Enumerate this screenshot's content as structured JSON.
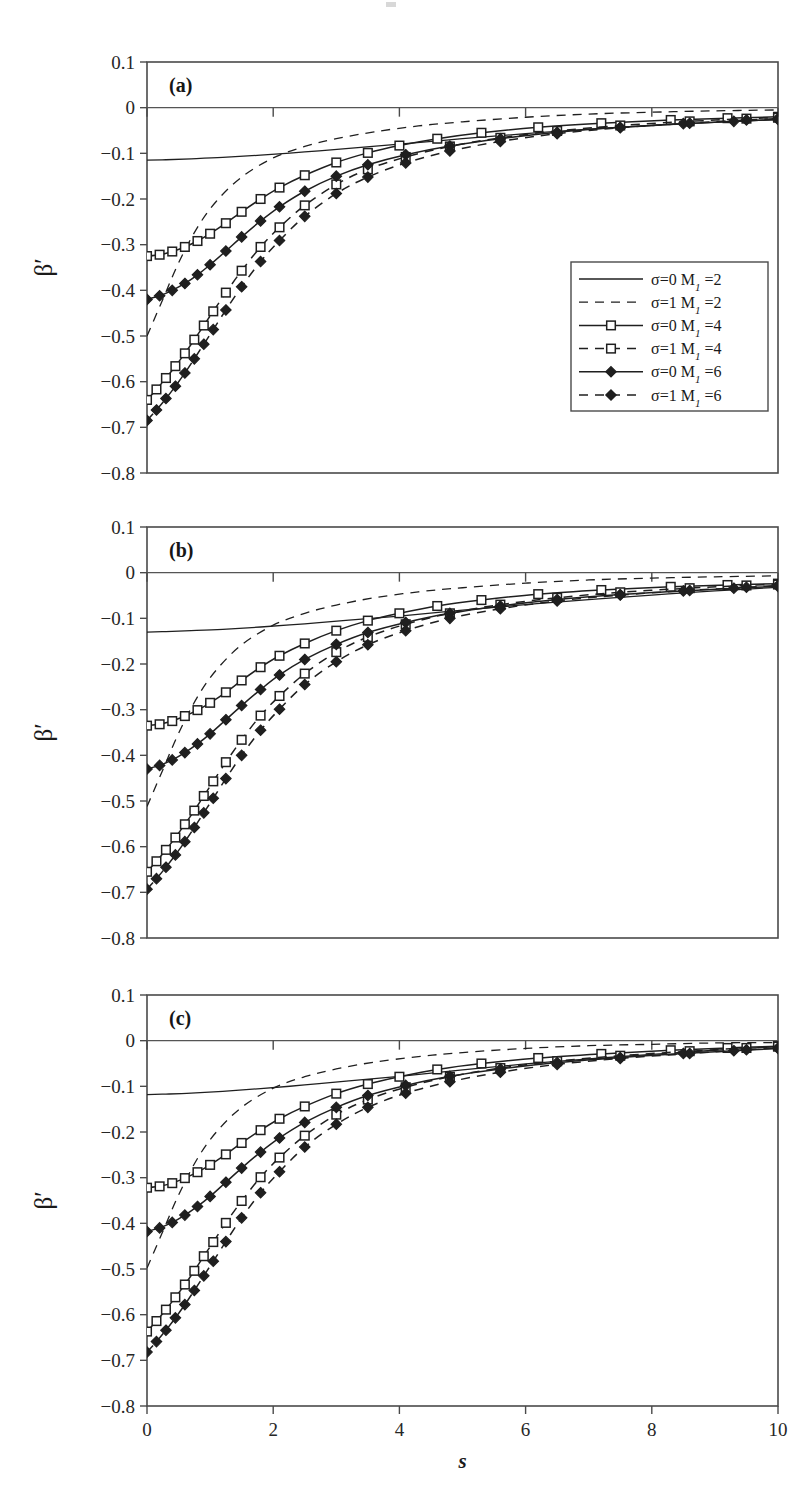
{
  "figure": {
    "panel_labels": [
      "(a)",
      "(b)",
      "(c)"
    ],
    "y_axis_title": "β′",
    "x_axis_title": "s",
    "y_ticks": [
      "0.1",
      "0",
      "−0.1",
      "−0.2",
      "−0.3",
      "−0.4",
      "−0.5",
      "−0.6",
      "−0.7",
      "−0.8"
    ],
    "x_ticks": [
      "0",
      "2",
      "4",
      "6",
      "8",
      "10"
    ],
    "legend": {
      "entries": [
        {
          "label": "σ=0 M",
          "sub": "1",
          "tail": " =2",
          "style": "solid",
          "marker": "none"
        },
        {
          "label": "σ=1 M",
          "sub": "1",
          "tail": " =2",
          "style": "dashed",
          "marker": "none"
        },
        {
          "label": "σ=0 M",
          "sub": "1",
          "tail": " =4",
          "style": "solid",
          "marker": "square"
        },
        {
          "label": "σ=1 M",
          "sub": "1",
          "tail": " =4",
          "style": "dashed",
          "marker": "square"
        },
        {
          "label": "σ=0 M",
          "sub": "1",
          "tail": " =6",
          "style": "solid",
          "marker": "diamond"
        },
        {
          "label": "σ=1 M",
          "sub": "1",
          "tail": " =6",
          "style": "dashed",
          "marker": "diamond"
        }
      ]
    }
  },
  "chart_data": {
    "type": "line",
    "title": "",
    "xlabel": "s",
    "ylabel": "β′",
    "xlim": [
      0,
      10
    ],
    "ylim": [
      -0.8,
      0.1
    ],
    "xticks": [
      0,
      2,
      4,
      6,
      8,
      10
    ],
    "yticks": [
      0.1,
      0,
      -0.1,
      -0.2,
      -0.3,
      -0.4,
      -0.5,
      -0.6,
      -0.7,
      -0.8
    ],
    "grid": false,
    "legend_position": "inside-right-panel-a",
    "panels": [
      {
        "label": "(a)",
        "series": [
          {
            "name": "σ=0 M1 =2",
            "style": "solid",
            "marker": "none",
            "x": [
              0,
              0.3,
              0.7,
              1.2,
              1.8,
              2.5,
              3.2,
              4.0,
              5.0,
              6.0,
              7.0,
              8.0,
              9.0,
              10.0
            ],
            "y": [
              -0.115,
              -0.114,
              -0.112,
              -0.109,
              -0.104,
              -0.097,
              -0.089,
              -0.08,
              -0.068,
              -0.057,
              -0.047,
              -0.039,
              -0.032,
              -0.026
            ]
          },
          {
            "name": "σ=1 M1 =2",
            "style": "dashed",
            "marker": "none",
            "x": [
              0,
              0.25,
              0.5,
              0.8,
              1.1,
              1.5,
              2.0,
              2.5,
              3.0,
              3.6,
              4.3,
              5.0,
              6.0,
              7.0,
              8.0,
              9.0,
              10.0
            ],
            "y": [
              -0.5,
              -0.42,
              -0.34,
              -0.262,
              -0.205,
              -0.152,
              -0.11,
              -0.085,
              -0.068,
              -0.053,
              -0.04,
              -0.031,
              -0.021,
              -0.014,
              -0.01,
              -0.007,
              -0.005
            ]
          },
          {
            "name": "σ=0 M1 =4",
            "style": "solid",
            "marker": "square",
            "x": [
              0,
              0.2,
              0.4,
              0.6,
              0.8,
              1.0,
              1.25,
              1.5,
              1.8,
              2.1,
              2.5,
              3.0,
              3.5,
              4.0,
              4.6,
              5.3,
              6.2,
              7.2,
              8.3,
              9.2,
              10.0
            ],
            "y": [
              -0.325,
              -0.322,
              -0.315,
              -0.305,
              -0.292,
              -0.276,
              -0.253,
              -0.228,
              -0.2,
              -0.175,
              -0.148,
              -0.12,
              -0.099,
              -0.083,
              -0.068,
              -0.055,
              -0.043,
              -0.034,
              -0.027,
              -0.023,
              -0.02
            ]
          },
          {
            "name": "σ=1 M1 =4",
            "style": "dashed",
            "marker": "square",
            "x": [
              0,
              0.15,
              0.3,
              0.45,
              0.6,
              0.75,
              0.9,
              1.05,
              1.25,
              1.5,
              1.8,
              2.1,
              2.5,
              3.0,
              3.5,
              4.1,
              4.8,
              5.6,
              6.5,
              7.5,
              8.6,
              9.5,
              10.0
            ],
            "y": [
              -0.64,
              -0.617,
              -0.592,
              -0.566,
              -0.538,
              -0.508,
              -0.477,
              -0.446,
              -0.405,
              -0.357,
              -0.305,
              -0.262,
              -0.214,
              -0.168,
              -0.135,
              -0.108,
              -0.085,
              -0.066,
              -0.051,
              -0.039,
              -0.03,
              -0.024,
              -0.022
            ]
          },
          {
            "name": "σ=0 M1 =6",
            "style": "solid",
            "marker": "diamond",
            "x": [
              0,
              0.2,
              0.4,
              0.6,
              0.8,
              1.0,
              1.25,
              1.5,
              1.8,
              2.1,
              2.5,
              3.0,
              3.5,
              4.1,
              4.8,
              5.6,
              6.5,
              7.5,
              8.5,
              9.3,
              10.0
            ],
            "y": [
              -0.42,
              -0.412,
              -0.4,
              -0.385,
              -0.366,
              -0.344,
              -0.314,
              -0.283,
              -0.248,
              -0.217,
              -0.183,
              -0.15,
              -0.125,
              -0.103,
              -0.084,
              -0.068,
              -0.054,
              -0.043,
              -0.035,
              -0.03,
              -0.026
            ]
          },
          {
            "name": "σ=1 M1 =6",
            "style": "dashed",
            "marker": "diamond",
            "x": [
              0,
              0.15,
              0.3,
              0.45,
              0.6,
              0.75,
              0.9,
              1.05,
              1.25,
              1.5,
              1.8,
              2.1,
              2.5,
              3.0,
              3.5,
              4.1,
              4.8,
              5.6,
              6.5,
              7.5,
              8.6,
              9.5,
              10.0
            ],
            "y": [
              -0.685,
              -0.662,
              -0.637,
              -0.61,
              -0.581,
              -0.55,
              -0.518,
              -0.486,
              -0.443,
              -0.392,
              -0.337,
              -0.291,
              -0.238,
              -0.188,
              -0.152,
              -0.121,
              -0.095,
              -0.074,
              -0.057,
              -0.044,
              -0.034,
              -0.027,
              -0.024
            ]
          }
        ]
      },
      {
        "label": "(b)",
        "series": [
          {
            "name": "σ=0 M1 =2",
            "style": "solid",
            "marker": "none",
            "x": [
              0,
              0.3,
              0.7,
              1.2,
              1.8,
              2.5,
              3.2,
              4.0,
              5.0,
              6.0,
              7.0,
              8.0,
              9.0,
              10.0
            ],
            "y": [
              -0.13,
              -0.129,
              -0.127,
              -0.124,
              -0.119,
              -0.112,
              -0.104,
              -0.095,
              -0.082,
              -0.07,
              -0.059,
              -0.049,
              -0.04,
              -0.032
            ]
          },
          {
            "name": "σ=1 M1 =2",
            "style": "dashed",
            "marker": "none",
            "x": [
              0,
              0.25,
              0.5,
              0.8,
              1.1,
              1.5,
              2.0,
              2.5,
              3.0,
              3.6,
              4.3,
              5.0,
              6.0,
              7.0,
              8.0,
              9.0,
              10.0
            ],
            "y": [
              -0.512,
              -0.432,
              -0.352,
              -0.272,
              -0.213,
              -0.158,
              -0.115,
              -0.089,
              -0.071,
              -0.055,
              -0.042,
              -0.033,
              -0.023,
              -0.016,
              -0.012,
              -0.009,
              -0.007
            ]
          },
          {
            "name": "σ=0 M1 =4",
            "style": "solid",
            "marker": "square",
            "x": [
              0,
              0.2,
              0.4,
              0.6,
              0.8,
              1.0,
              1.25,
              1.5,
              1.8,
              2.1,
              2.5,
              3.0,
              3.5,
              4.0,
              4.6,
              5.3,
              6.2,
              7.2,
              8.3,
              9.2,
              10.0
            ],
            "y": [
              -0.335,
              -0.332,
              -0.325,
              -0.314,
              -0.301,
              -0.285,
              -0.262,
              -0.236,
              -0.207,
              -0.182,
              -0.155,
              -0.127,
              -0.105,
              -0.089,
              -0.073,
              -0.06,
              -0.047,
              -0.038,
              -0.031,
              -0.027,
              -0.024
            ]
          },
          {
            "name": "σ=1 M1 =4",
            "style": "dashed",
            "marker": "square",
            "x": [
              0,
              0.15,
              0.3,
              0.45,
              0.6,
              0.75,
              0.9,
              1.05,
              1.25,
              1.5,
              1.8,
              2.1,
              2.5,
              3.0,
              3.5,
              4.1,
              4.8,
              5.6,
              6.5,
              7.5,
              8.6,
              9.5,
              10.0
            ],
            "y": [
              -0.655,
              -0.632,
              -0.607,
              -0.58,
              -0.551,
              -0.521,
              -0.489,
              -0.457,
              -0.415,
              -0.366,
              -0.313,
              -0.27,
              -0.221,
              -0.174,
              -0.141,
              -0.113,
              -0.089,
              -0.07,
              -0.055,
              -0.043,
              -0.034,
              -0.028,
              -0.026
            ]
          },
          {
            "name": "σ=0 M1 =6",
            "style": "solid",
            "marker": "diamond",
            "x": [
              0,
              0.2,
              0.4,
              0.6,
              0.8,
              1.0,
              1.25,
              1.5,
              1.8,
              2.1,
              2.5,
              3.0,
              3.5,
              4.1,
              4.8,
              5.6,
              6.5,
              7.5,
              8.5,
              9.3,
              10.0
            ],
            "y": [
              -0.43,
              -0.422,
              -0.41,
              -0.394,
              -0.375,
              -0.353,
              -0.322,
              -0.291,
              -0.256,
              -0.224,
              -0.19,
              -0.157,
              -0.131,
              -0.109,
              -0.089,
              -0.073,
              -0.059,
              -0.048,
              -0.04,
              -0.034,
              -0.03
            ]
          },
          {
            "name": "σ=1 M1 =6",
            "style": "dashed",
            "marker": "diamond",
            "x": [
              0,
              0.15,
              0.3,
              0.45,
              0.6,
              0.75,
              0.9,
              1.05,
              1.25,
              1.5,
              1.8,
              2.1,
              2.5,
              3.0,
              3.5,
              4.1,
              4.8,
              5.6,
              6.5,
              7.5,
              8.6,
              9.5,
              10.0
            ],
            "y": [
              -0.693,
              -0.67,
              -0.645,
              -0.618,
              -0.589,
              -0.558,
              -0.526,
              -0.494,
              -0.451,
              -0.4,
              -0.345,
              -0.299,
              -0.245,
              -0.195,
              -0.158,
              -0.127,
              -0.1,
              -0.079,
              -0.062,
              -0.049,
              -0.039,
              -0.032,
              -0.028
            ]
          }
        ]
      },
      {
        "label": "(c)",
        "series": [
          {
            "name": "σ=0 M1 =2",
            "style": "solid",
            "marker": "none",
            "x": [
              0,
              0.3,
              0.7,
              1.2,
              1.8,
              2.5,
              3.2,
              4.0,
              5.0,
              6.0,
              7.0,
              8.0,
              9.0,
              10.0
            ],
            "y": [
              -0.118,
              -0.117,
              -0.115,
              -0.111,
              -0.105,
              -0.097,
              -0.088,
              -0.078,
              -0.064,
              -0.051,
              -0.04,
              -0.03,
              -0.021,
              -0.013
            ]
          },
          {
            "name": "σ=1 M1 =2",
            "style": "dashed",
            "marker": "none",
            "x": [
              0,
              0.25,
              0.5,
              0.8,
              1.1,
              1.5,
              2.0,
              2.5,
              3.0,
              3.6,
              4.3,
              5.0,
              6.0,
              7.0,
              8.0,
              9.0,
              10.0
            ],
            "y": [
              -0.498,
              -0.418,
              -0.338,
              -0.258,
              -0.2,
              -0.146,
              -0.104,
              -0.079,
              -0.062,
              -0.047,
              -0.035,
              -0.026,
              -0.017,
              -0.011,
              -0.008,
              -0.005,
              -0.004
            ]
          },
          {
            "name": "σ=0 M1 =4",
            "style": "solid",
            "marker": "square",
            "x": [
              0,
              0.2,
              0.4,
              0.6,
              0.8,
              1.0,
              1.25,
              1.5,
              1.8,
              2.1,
              2.5,
              3.0,
              3.5,
              4.0,
              4.6,
              5.3,
              6.2,
              7.2,
              8.3,
              9.2,
              10.0
            ],
            "y": [
              -0.322,
              -0.319,
              -0.312,
              -0.301,
              -0.288,
              -0.272,
              -0.249,
              -0.224,
              -0.196,
              -0.171,
              -0.144,
              -0.116,
              -0.095,
              -0.079,
              -0.063,
              -0.05,
              -0.038,
              -0.029,
              -0.021,
              -0.016,
              -0.012
            ]
          },
          {
            "name": "σ=1 M1 =4",
            "style": "dashed",
            "marker": "square",
            "x": [
              0,
              0.15,
              0.3,
              0.45,
              0.6,
              0.75,
              0.9,
              1.05,
              1.25,
              1.5,
              1.8,
              2.1,
              2.5,
              3.0,
              3.5,
              4.1,
              4.8,
              5.6,
              6.5,
              7.5,
              8.6,
              9.5,
              10.0
            ],
            "y": [
              -0.637,
              -0.614,
              -0.589,
              -0.562,
              -0.534,
              -0.504,
              -0.472,
              -0.441,
              -0.399,
              -0.351,
              -0.299,
              -0.256,
              -0.208,
              -0.162,
              -0.129,
              -0.102,
              -0.079,
              -0.06,
              -0.045,
              -0.033,
              -0.023,
              -0.016,
              -0.013
            ]
          },
          {
            "name": "σ=0 M1 =6",
            "style": "solid",
            "marker": "diamond",
            "x": [
              0,
              0.2,
              0.4,
              0.6,
              0.8,
              1.0,
              1.25,
              1.5,
              1.8,
              2.1,
              2.5,
              3.0,
              3.5,
              4.1,
              4.8,
              5.6,
              6.5,
              7.5,
              8.5,
              9.3,
              10.0
            ],
            "y": [
              -0.418,
              -0.41,
              -0.398,
              -0.382,
              -0.363,
              -0.341,
              -0.31,
              -0.279,
              -0.244,
              -0.213,
              -0.179,
              -0.146,
              -0.12,
              -0.098,
              -0.078,
              -0.062,
              -0.048,
              -0.037,
              -0.028,
              -0.022,
              -0.017
            ]
          },
          {
            "name": "σ=1 M1 =6",
            "style": "dashed",
            "marker": "diamond",
            "x": [
              0,
              0.15,
              0.3,
              0.45,
              0.6,
              0.75,
              0.9,
              1.05,
              1.25,
              1.5,
              1.8,
              2.1,
              2.5,
              3.0,
              3.5,
              4.1,
              4.8,
              5.6,
              6.5,
              7.5,
              8.6,
              9.5,
              10.0
            ],
            "y": [
              -0.682,
              -0.659,
              -0.634,
              -0.607,
              -0.578,
              -0.547,
              -0.515,
              -0.483,
              -0.44,
              -0.388,
              -0.333,
              -0.287,
              -0.233,
              -0.183,
              -0.146,
              -0.115,
              -0.09,
              -0.069,
              -0.052,
              -0.039,
              -0.028,
              -0.02,
              -0.016
            ]
          }
        ]
      }
    ]
  }
}
